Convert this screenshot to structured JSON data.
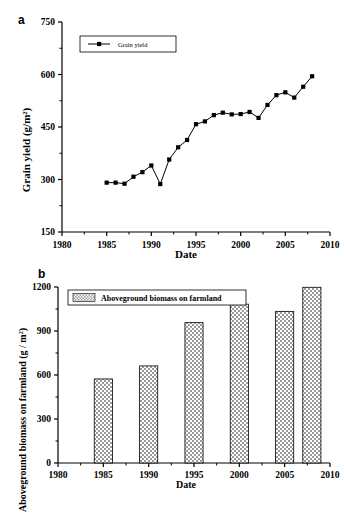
{
  "figure": {
    "panel_a_letter": "a",
    "panel_b_letter": "b"
  },
  "chart_data": [
    {
      "id": "panel-a",
      "type": "line",
      "title": "",
      "xlabel": "Date",
      "ylabel": "Grain yield (g/m",
      "ylabel_sup": "2",
      "ylabel_tail": ")",
      "xlim": [
        1980,
        2010
      ],
      "ylim": [
        150,
        750
      ],
      "xticks": [
        1980,
        1985,
        1990,
        1995,
        2000,
        2005,
        2010
      ],
      "xtick_labels": [
        "1980",
        "1985",
        "1990",
        "1995",
        "2000",
        "2005",
        "2010"
      ],
      "yticks": [
        150,
        300,
        450,
        600,
        750
      ],
      "ytick_labels": [
        "150",
        "300",
        "450",
        "600",
        "750"
      ],
      "grid": false,
      "legend_position": "upper-left",
      "legend": [
        "Grain yield"
      ],
      "marker": "square",
      "series": [
        {
          "name": "Grain yield",
          "x": [
            1985,
            1986,
            1987,
            1988,
            1989,
            1990,
            1991,
            1992,
            1993,
            1994,
            1995,
            1996,
            1997,
            1998,
            1999,
            2000,
            2001,
            2002,
            2003,
            2004,
            2005,
            2006,
            2007,
            2008
          ],
          "values": [
            291,
            291,
            288,
            308,
            321,
            340,
            287,
            357,
            392,
            413,
            458,
            466,
            484,
            491,
            486,
            487,
            493,
            476,
            513,
            541,
            549,
            534,
            565,
            595
          ]
        }
      ]
    },
    {
      "id": "panel-b",
      "type": "bar",
      "title": "",
      "xlabel": "Date",
      "ylabel": "Aboveground biomass on farmland (g / m",
      "ylabel_sup": "2",
      "ylabel_tail": ")",
      "xlim": [
        1980,
        2010
      ],
      "ylim": [
        0,
        1200
      ],
      "xticks": [
        1980,
        1985,
        1990,
        1995,
        2000,
        2005,
        2010
      ],
      "xtick_labels": [
        "1980",
        "1985",
        "1990",
        "1995",
        "2000",
        "2005",
        "2010"
      ],
      "yticks": [
        0,
        300,
        600,
        900,
        1200
      ],
      "ytick_labels": [
        "0",
        "300",
        "600",
        "900",
        "1200"
      ],
      "grid": false,
      "legend_position": "upper-left",
      "legend": [
        "Aboveground biomass on farmland"
      ],
      "bar_fill": "crosshatch",
      "categories": [
        1985,
        1990,
        1995,
        2000,
        2005,
        2008
      ],
      "values": [
        573,
        662,
        957,
        1083,
        1034,
        1198
      ],
      "series": [
        {
          "name": "Aboveground biomass on farmland",
          "x": [
            1985,
            1990,
            1995,
            2000,
            2005,
            2008
          ],
          "values": [
            573,
            662,
            957,
            1083,
            1034,
            1198
          ]
        }
      ]
    }
  ],
  "colors": {
    "axis": "#000000",
    "marker": "#000000",
    "line": "#000000",
    "bar_pattern": "#808080",
    "background": "#ffffff"
  }
}
